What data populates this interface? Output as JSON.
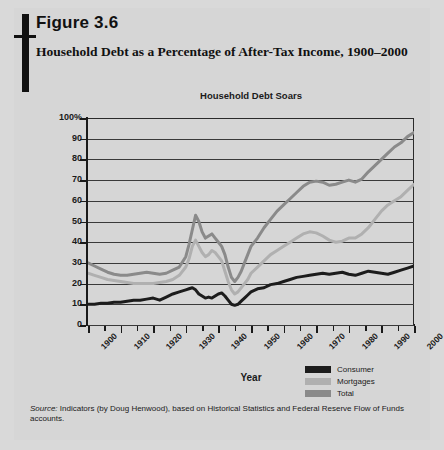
{
  "figure": {
    "number": "Figure 3.6",
    "title": "Household Debt as a Percentage of After-Tax Income, 1900–2000"
  },
  "source": {
    "label": "Source:",
    "text": " Indicators (by Doug Henwood), based on Historical Statistics and Federal Reserve Flow of Funds accounts."
  },
  "colors": {
    "page_background": "#d6d6d6",
    "consumer": "#1c1c1c",
    "mortgages": "#b0b0b0",
    "total": "#8a8a8a",
    "axis": "#1a1a1a",
    "gridline": "#3a3a3a"
  },
  "chart_data": {
    "type": "line",
    "title": "Household Debt Soars",
    "xlabel": "Year",
    "ylabel": "Percentage",
    "xlim": [
      1900,
      2000
    ],
    "ylim": [
      0,
      100
    ],
    "grid": true,
    "legend_position": "bottom-right",
    "ytick_labels": [
      "100%",
      "90",
      "80",
      "70",
      "60",
      "50",
      "40",
      "30",
      "20",
      "10",
      "0"
    ],
    "ytick_values": [
      100,
      90,
      80,
      70,
      60,
      50,
      40,
      30,
      20,
      10,
      0
    ],
    "xtick_labels": [
      "1900",
      "1910",
      "1920",
      "1930",
      "1940",
      "1950",
      "1960",
      "1970",
      "1980",
      "1990",
      "2000"
    ],
    "xtick_values": [
      1900,
      1910,
      1920,
      1930,
      1940,
      1950,
      1960,
      1970,
      1980,
      1990,
      2000
    ],
    "xtick_minor_values": [
      1905,
      1915,
      1925,
      1935,
      1945,
      1955,
      1965,
      1975,
      1985,
      1995
    ],
    "x": [
      1900,
      1902,
      1904,
      1906,
      1908,
      1910,
      1912,
      1914,
      1916,
      1918,
      1920,
      1922,
      1924,
      1926,
      1928,
      1930,
      1931,
      1932,
      1933,
      1934,
      1935,
      1936,
      1937,
      1938,
      1939,
      1940,
      1941,
      1942,
      1943,
      1944,
      1945,
      1946,
      1947,
      1948,
      1949,
      1950,
      1952,
      1954,
      1956,
      1958,
      1960,
      1962,
      1964,
      1966,
      1968,
      1970,
      1972,
      1974,
      1976,
      1978,
      1980,
      1982,
      1984,
      1986,
      1988,
      1990,
      1992,
      1994,
      1996,
      1998,
      2000
    ],
    "series": [
      {
        "name": "Consumer",
        "color": "#1c1c1c",
        "values": [
          10,
          10,
          10.5,
          10.5,
          11,
          11,
          11.5,
          12,
          12,
          12.5,
          13,
          12,
          13.5,
          15,
          16,
          17,
          17.5,
          18,
          17,
          15,
          14,
          13,
          13.5,
          13,
          14,
          15,
          15.5,
          14,
          12,
          10,
          9.5,
          10,
          11.5,
          13,
          14.5,
          16,
          17.5,
          18,
          19.5,
          20,
          21,
          22,
          23,
          23.5,
          24,
          24.5,
          25,
          24.5,
          25,
          25.5,
          24.5,
          24,
          25,
          26,
          25.5,
          25,
          24.5,
          25.5,
          26.5,
          27.5,
          28.5
        ]
      },
      {
        "name": "Mortgages",
        "color": "#b0b0b0",
        "values": [
          25,
          24,
          23,
          22,
          21.5,
          21,
          20.5,
          20,
          20,
          20,
          20,
          20.5,
          21,
          22,
          24,
          28,
          32,
          38,
          41,
          38,
          35,
          33,
          34,
          36,
          35,
          33,
          31,
          26,
          21,
          17,
          15,
          16,
          18,
          20,
          22,
          25,
          28,
          31,
          34,
          36,
          38,
          40,
          42,
          44,
          45,
          44.5,
          43,
          41,
          40,
          40.5,
          42,
          42,
          44,
          47,
          51,
          55,
          58,
          60,
          62,
          65,
          68
        ]
      },
      {
        "name": "Total",
        "color": "#8a8a8a",
        "values": [
          30,
          28.5,
          27,
          25.5,
          24.5,
          24,
          24,
          24.5,
          25,
          25.5,
          25,
          24.5,
          25,
          26.5,
          28,
          33,
          39,
          46,
          53,
          50,
          45,
          42,
          43,
          44,
          42,
          40,
          38,
          34,
          28,
          23,
          21,
          23,
          26,
          30,
          34,
          38,
          42,
          47,
          51,
          55,
          58,
          61,
          64,
          67,
          69,
          69.5,
          69,
          67.5,
          68,
          69,
          70,
          69,
          70.5,
          74,
          77,
          80,
          83,
          86,
          88,
          91,
          93
        ]
      }
    ]
  }
}
